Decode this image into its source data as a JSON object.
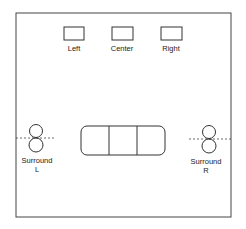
{
  "diagram": {
    "speakers": {
      "left": {
        "label": "Left"
      },
      "center": {
        "label": "Center"
      },
      "right": {
        "label": "Right"
      },
      "surround_left": {
        "label_line1": "Surround",
        "label_line2": "L"
      },
      "surround_right": {
        "label_line1": "Surround",
        "label_line2": "R"
      }
    },
    "couch": {
      "sections": 3
    },
    "colors": {
      "stroke": "#333333",
      "background": "#ffffff"
    }
  }
}
